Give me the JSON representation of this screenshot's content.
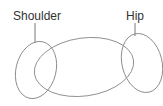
{
  "diagram": {
    "labels": {
      "shoulder": "Shoulder",
      "hip": "Hip"
    },
    "stroke_color": "#8a8a8a",
    "text_color": "#333333"
  }
}
